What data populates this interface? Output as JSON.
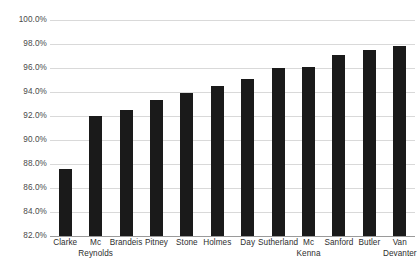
{
  "chart_data": {
    "type": "bar",
    "title": "",
    "subtitle": "",
    "xlabel": "",
    "ylabel": "",
    "categories": [
      "Clarke",
      "Mc Reynolds",
      "Brandeis",
      "Pitney",
      "Stone",
      "Holmes",
      "Day",
      "Sutherland",
      "Mc Kenna",
      "Sanford",
      "Butler",
      "Van Devanter"
    ],
    "category_lines": [
      [
        "Clarke"
      ],
      [
        "Mc",
        "Reynolds"
      ],
      [
        "Brandeis"
      ],
      [
        "Pitney"
      ],
      [
        "Stone"
      ],
      [
        "Holmes"
      ],
      [
        "Day"
      ],
      [
        "Sutherland"
      ],
      [
        "Mc",
        "Kenna"
      ],
      [
        "Sanford"
      ],
      [
        "Butler"
      ],
      [
        "Van",
        "Devanter"
      ]
    ],
    "values": [
      87.6,
      92.0,
      92.5,
      93.3,
      93.9,
      94.5,
      95.1,
      96.0,
      96.1,
      97.1,
      97.5,
      97.8
    ],
    "value_labels": [
      "87.6%",
      "92.0%",
      "92.5%",
      "93.3%",
      "93.9%",
      "94.5%",
      "95.1%",
      "96.0%",
      "96.1%",
      "97.1%",
      "97.5%",
      "97.8%"
    ],
    "ylim": [
      82.0,
      100.0
    ],
    "ytick_values": [
      100.0,
      98.0,
      96.0,
      94.0,
      92.0,
      90.0,
      88.0,
      86.0,
      84.0,
      82.0
    ],
    "ytick_labels": [
      "100.0%",
      "98.0%",
      "96.0%",
      "94.0%",
      "92.0%",
      "90.0%",
      "88.0%",
      "86.0%",
      "84.0%",
      "82.0%"
    ],
    "grid": true,
    "legend": false,
    "legend_position": "none",
    "series": [
      {
        "name": "",
        "color": "#1a1a1a",
        "values": [
          87.6,
          92.0,
          92.5,
          93.3,
          93.9,
          94.5,
          95.1,
          96.0,
          96.1,
          97.1,
          97.5,
          97.8
        ]
      }
    ],
    "colors": {
      "bar": "#1a1a1a",
      "gridline": "#d9d9d9",
      "axis": "#9a9a9a",
      "tick_text": "#4a4a4a",
      "category_text": "#2e2e2e",
      "background": "#ffffff"
    }
  }
}
